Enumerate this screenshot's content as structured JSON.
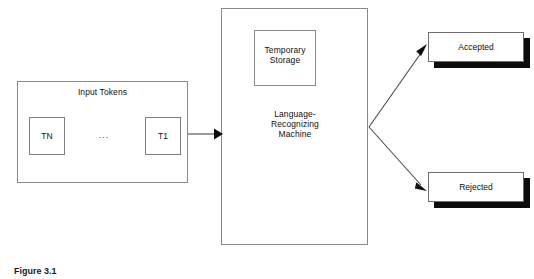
{
  "diagram": {
    "input_group": {
      "title": "Input Tokens",
      "tokens": [
        {
          "label": "TN"
        },
        {
          "label": "T1"
        }
      ],
      "ellipsis": "..."
    },
    "machine": {
      "label": "Language-\nRecognizing\nMachine",
      "storage_label": "Temporary\nStorage"
    },
    "outcomes": [
      {
        "label": "Accepted"
      },
      {
        "label": "Rejected"
      }
    ]
  },
  "caption": {
    "text": "Figure 3.1"
  },
  "colors": {
    "background": "#ffffff",
    "box_border": "#8a8a8a",
    "shadow": "#0c0c0c",
    "arrow": "#4a4a4a",
    "text": "#111111"
  }
}
